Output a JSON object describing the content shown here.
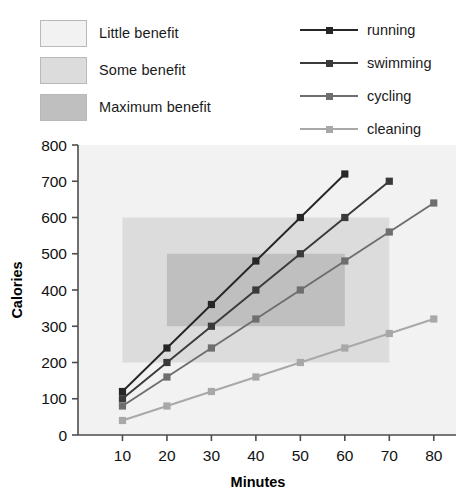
{
  "band_legend": {
    "items": [
      {
        "label": "Little benefit",
        "color": "#f2f2f2"
      },
      {
        "label": "Some benefit",
        "color": "#dcdcdc"
      },
      {
        "label": "Maximum benefit",
        "color": "#bfbfbf"
      }
    ]
  },
  "series_legend": {
    "items": [
      {
        "label": "running",
        "color": "#262626"
      },
      {
        "label": "swimming",
        "color": "#3a3a3a"
      },
      {
        "label": "cycling",
        "color": "#6e6e6e"
      },
      {
        "label": "cleaning",
        "color": "#a8a8a8"
      }
    ]
  },
  "chart_data": {
    "type": "line",
    "title": "",
    "xlabel": "Minutes",
    "ylabel": "Calories",
    "xlim": [
      0,
      85
    ],
    "ylim": [
      0,
      800
    ],
    "xticks": [
      10,
      20,
      30,
      40,
      50,
      60,
      70,
      80
    ],
    "yticks": [
      0,
      100,
      200,
      300,
      400,
      500,
      600,
      700,
      800
    ],
    "grid": false,
    "legend_position": "top-right",
    "series": [
      {
        "name": "running",
        "color": "#262626",
        "x": [
          10,
          20,
          30,
          40,
          50,
          60
        ],
        "values": [
          120,
          240,
          360,
          480,
          600,
          720
        ]
      },
      {
        "name": "swimming",
        "color": "#3a3a3a",
        "x": [
          10,
          20,
          30,
          40,
          50,
          60,
          70
        ],
        "values": [
          100,
          200,
          300,
          400,
          500,
          600,
          700
        ]
      },
      {
        "name": "cycling",
        "color": "#6e6e6e",
        "x": [
          10,
          20,
          30,
          40,
          50,
          60,
          70,
          80
        ],
        "values": [
          80,
          160,
          240,
          320,
          400,
          480,
          560,
          640
        ]
      },
      {
        "name": "cleaning",
        "color": "#a8a8a8",
        "x": [
          10,
          20,
          30,
          40,
          50,
          60,
          70,
          80
        ],
        "values": [
          40,
          80,
          120,
          160,
          200,
          240,
          280,
          320
        ]
      }
    ],
    "bands": [
      {
        "name": "Little benefit",
        "x0": 0,
        "x1": 85,
        "y0": 0,
        "y1": 800,
        "color": "#f2f2f2"
      },
      {
        "name": "Some benefit",
        "x0": 10,
        "x1": 70,
        "y0": 200,
        "y1": 600,
        "color": "#dcdcdc"
      },
      {
        "name": "Maximum benefit",
        "x0": 20,
        "x1": 60,
        "y0": 300,
        "y1": 500,
        "color": "#bfbfbf"
      }
    ]
  }
}
